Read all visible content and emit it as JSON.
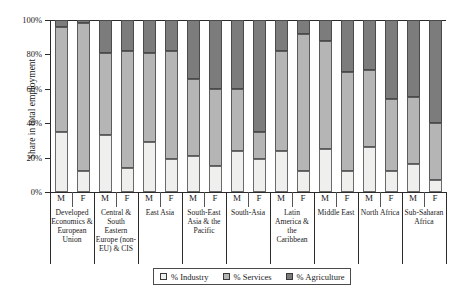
{
  "chart_data": {
    "type": "bar",
    "subtype": "stacked-bar-100pct",
    "title": "",
    "xlabel": "",
    "ylabel": "Share in total employment",
    "ylim": [
      0,
      100
    ],
    "ytick_labels": [
      "0%",
      "20%",
      "40%",
      "60%",
      "80%",
      "100%"
    ],
    "ytick_values": [
      0,
      20,
      40,
      60,
      80,
      100
    ],
    "grid": false,
    "legend_position": "bottom",
    "legend": [
      "% Industry",
      "% Services",
      "% Agriculture"
    ],
    "sex_labels": [
      "M",
      "F"
    ],
    "categories": [
      "Developed Economics & European Union",
      "Central & South Eastern Europe (non-EU) & CIS",
      "East Asia",
      "South-East Asia & the Pacific",
      "South-Asia",
      "Latin America & the Caribbean",
      "Middle East",
      "North Africa",
      "Sub-Saharan Africa"
    ],
    "bars": [
      {
        "group": "Developed Economics & European Union",
        "sex": "M",
        "industry": 35,
        "services": 61,
        "agriculture": 4
      },
      {
        "group": "Developed Economics & European Union",
        "sex": "F",
        "industry": 12,
        "services": 86,
        "agriculture": 2
      },
      {
        "group": "Central & South Eastern Europe (non-EU) & CIS",
        "sex": "M",
        "industry": 33,
        "services": 48,
        "agriculture": 19
      },
      {
        "group": "Central & South Eastern Europe (non-EU) & CIS",
        "sex": "F",
        "industry": 14,
        "services": 68,
        "agriculture": 18
      },
      {
        "group": "East Asia",
        "sex": "M",
        "industry": 29,
        "services": 52,
        "agriculture": 19
      },
      {
        "group": "East Asia",
        "sex": "F",
        "industry": 19,
        "services": 63,
        "agriculture": 18
      },
      {
        "group": "South-East Asia & the Pacific",
        "sex": "M",
        "industry": 21,
        "services": 45,
        "agriculture": 34
      },
      {
        "group": "South-East Asia & the Pacific",
        "sex": "F",
        "industry": 15,
        "services": 45,
        "agriculture": 40
      },
      {
        "group": "South-Asia",
        "sex": "M",
        "industry": 24,
        "services": 36,
        "agriculture": 40
      },
      {
        "group": "South-Asia",
        "sex": "F",
        "industry": 19,
        "services": 16,
        "agriculture": 65
      },
      {
        "group": "Latin America & the Caribbean",
        "sex": "M",
        "industry": 24,
        "services": 58,
        "agriculture": 18
      },
      {
        "group": "Latin America & the Caribbean",
        "sex": "F",
        "industry": 12,
        "services": 80,
        "agriculture": 8
      },
      {
        "group": "Middle East",
        "sex": "M",
        "industry": 25,
        "services": 63,
        "agriculture": 12
      },
      {
        "group": "Middle East",
        "sex": "F",
        "industry": 12,
        "services": 58,
        "agriculture": 30
      },
      {
        "group": "North Africa",
        "sex": "M",
        "industry": 26,
        "services": 45,
        "agriculture": 29
      },
      {
        "group": "North Africa",
        "sex": "F",
        "industry": 12,
        "services": 42,
        "agriculture": 46
      },
      {
        "group": "Sub-Saharan Africa",
        "sex": "M",
        "industry": 16,
        "services": 39,
        "agriculture": 45
      },
      {
        "group": "Sub-Saharan Africa",
        "sex": "F",
        "industry": 7,
        "services": 33,
        "agriculture": 60
      }
    ],
    "colors": {
      "industry": "#efefee",
      "services": "#b5b5b5",
      "agriculture": "#7c7c7c",
      "axis": "#2b2b2b",
      "text": "#1a1a1a"
    }
  },
  "axis": {
    "y_title": "Share in total employment"
  },
  "legend": {
    "items": [
      {
        "label": "% Industry",
        "key": "industry"
      },
      {
        "label": "% Services",
        "key": "services"
      },
      {
        "label": "% Agriculture",
        "key": "agriculture"
      }
    ]
  }
}
